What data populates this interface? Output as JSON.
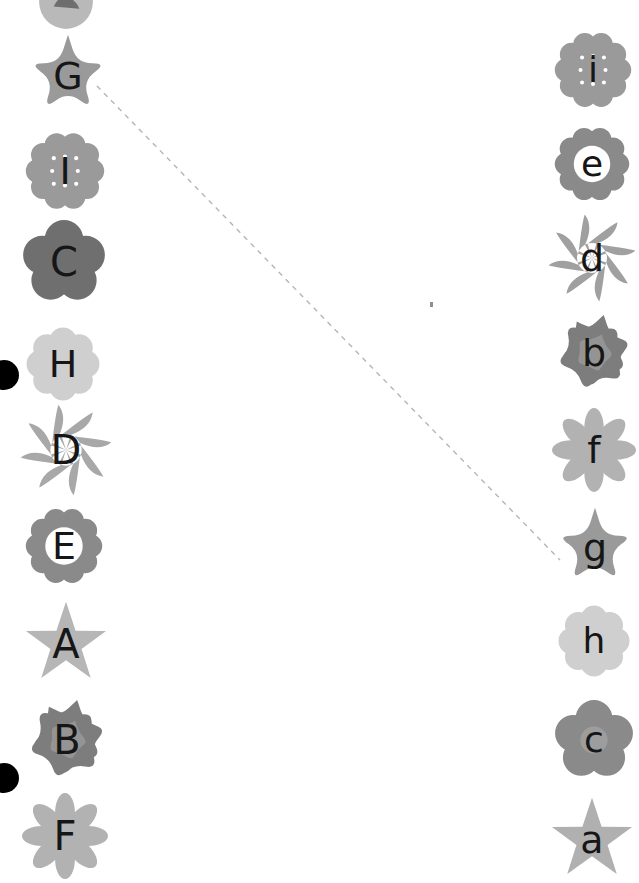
{
  "canvas": {
    "width": 639,
    "height": 862,
    "background": "#ffffff"
  },
  "task": {
    "kind": "matching-puzzle",
    "description": "Match uppercase lettered flowers on the left with lowercase lettered flowers on the right",
    "left_column_label": "uppercase",
    "right_column_label": "lowercase"
  },
  "left_items": [
    {
      "label": "",
      "shape": "circle-photo",
      "color": "#b9b9b9",
      "x": 66,
      "y": 2,
      "size": 56,
      "letter_size": 0,
      "cut": "top",
      "glyph_color": "#161616",
      "center_color": ""
    },
    {
      "label": "G",
      "shape": "star5-rounded",
      "color": "#9a9a9a",
      "x": 68,
      "y": 76,
      "size": 86,
      "letter_size": 38,
      "cut": "none",
      "glyph_color": "#161616",
      "center_color": ""
    },
    {
      "label": "I",
      "shape": "daisy10-dots",
      "color": "#9a9a9a",
      "x": 65,
      "y": 171,
      "size": 80,
      "letter_size": 38,
      "cut": "none",
      "glyph_color": "#161616",
      "center_color": ""
    },
    {
      "label": "C",
      "shape": "petal5-round",
      "color": "#6f6f6f",
      "x": 64,
      "y": 262,
      "size": 84,
      "letter_size": 40,
      "cut": "none",
      "glyph_color": "#161616",
      "center_color": ""
    },
    {
      "label": "H",
      "shape": "petal8-blob",
      "color": "#cfcfcf",
      "x": 63,
      "y": 364,
      "size": 76,
      "letter_size": 38,
      "cut": "none",
      "glyph_color": "#161616",
      "center_color": ""
    },
    {
      "label": "D",
      "shape": "pinwheel8",
      "color": "#a8a8a8",
      "x": 66,
      "y": 450,
      "size": 92,
      "letter_size": 40,
      "cut": "none",
      "glyph_color": "#161616",
      "center_color": ""
    },
    {
      "label": "E",
      "shape": "daisy10-hole",
      "color": "#8a8a8a",
      "x": 64,
      "y": 546,
      "size": 78,
      "letter_size": 38,
      "cut": "none",
      "glyph_color": "#161616",
      "center_color": "#ffffff"
    },
    {
      "label": "A",
      "shape": "star5-sharp",
      "color": "#b6b6b6",
      "x": 66,
      "y": 644,
      "size": 86,
      "letter_size": 40,
      "cut": "none",
      "glyph_color": "#161616",
      "center_color": ""
    },
    {
      "label": "B",
      "shape": "rose-layered",
      "color": "#7d7d7d",
      "x": 67,
      "y": 740,
      "size": 84,
      "letter_size": 40,
      "cut": "none",
      "glyph_color": "#161616",
      "center_color": "#949494"
    },
    {
      "label": "F",
      "shape": "daisy8-oval",
      "color": "#b2b2b2",
      "x": 65,
      "y": 836,
      "size": 86,
      "letter_size": 40,
      "cut": "bottom",
      "glyph_color": "#161616",
      "center_color": ""
    }
  ],
  "right_items": [
    {
      "label": "i",
      "shape": "daisy10-dots",
      "color": "#9a9a9a",
      "x": 593,
      "y": 70,
      "size": 78,
      "letter_size": 36,
      "cut": "none",
      "glyph_color": "#161616",
      "center_color": ""
    },
    {
      "label": "e",
      "shape": "daisy10-hole",
      "color": "#8a8a8a",
      "x": 592,
      "y": 164,
      "size": 76,
      "letter_size": 36,
      "cut": "none",
      "glyph_color": "#161616",
      "center_color": "#ffffff"
    },
    {
      "label": "d",
      "shape": "pinwheel8",
      "color": "#a0a0a0",
      "x": 592,
      "y": 258,
      "size": 88,
      "letter_size": 38,
      "cut": "none",
      "glyph_color": "#161616",
      "center_color": ""
    },
    {
      "label": "b",
      "shape": "rose-layered",
      "color": "#7d7d7d",
      "x": 594,
      "y": 353,
      "size": 80,
      "letter_size": 38,
      "cut": "none",
      "glyph_color": "#161616",
      "center_color": "#949494"
    },
    {
      "label": "f",
      "shape": "daisy8-oval",
      "color": "#b2b2b2",
      "x": 594,
      "y": 450,
      "size": 84,
      "letter_size": 38,
      "cut": "none",
      "glyph_color": "#161616",
      "center_color": ""
    },
    {
      "label": "g",
      "shape": "star5-rounded",
      "color": "#9a9a9a",
      "x": 595,
      "y": 548,
      "size": 84,
      "letter_size": 38,
      "cut": "none",
      "glyph_color": "#161616",
      "center_color": ""
    },
    {
      "label": "h",
      "shape": "petal8-blob",
      "color": "#cfcfcf",
      "x": 594,
      "y": 641,
      "size": 74,
      "letter_size": 36,
      "cut": "none",
      "glyph_color": "#161616",
      "center_color": ""
    },
    {
      "label": "c",
      "shape": "petal5-round",
      "color": "#8a8a8a",
      "x": 594,
      "y": 740,
      "size": 80,
      "letter_size": 36,
      "cut": "none",
      "glyph_color": "#161616",
      "center_color": "#9d9d9d"
    },
    {
      "label": "a",
      "shape": "star5-sharp",
      "color": "#b0b0b0",
      "x": 592,
      "y": 840,
      "size": 86,
      "letter_size": 38,
      "cut": "bottom",
      "glyph_color": "#161616",
      "center_color": ""
    }
  ],
  "connector": {
    "from_label": "G",
    "to_label": "g",
    "x1": 97,
    "y1": 86,
    "x2": 560,
    "y2": 560,
    "style": "dashed",
    "color": "#b5b5b5",
    "width": 1.4,
    "dash": "5 5"
  },
  "markers": [
    {
      "name": "selection-dot-upper",
      "x": 4,
      "y": 375,
      "r": 15,
      "color": "#000000"
    },
    {
      "name": "selection-dot-lower",
      "x": 4,
      "y": 778,
      "r": 15,
      "color": "#000000"
    }
  ],
  "speck": {
    "x": 430,
    "y": 302,
    "w": 3,
    "h": 5,
    "color": "#8e8e8e"
  }
}
